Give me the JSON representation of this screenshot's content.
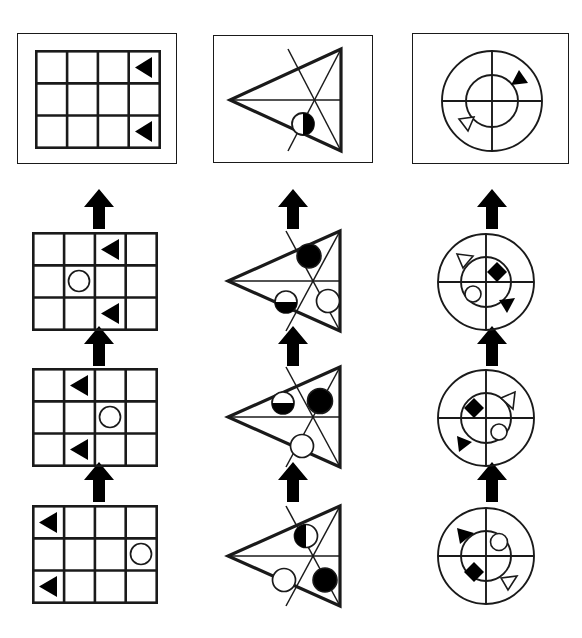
{
  "figure": {
    "type": "visual-reasoning-matrix",
    "columns": [
      {
        "id": "column-grid",
        "shape_kind": "grid",
        "grid_cols": 4,
        "grid_rows": 3,
        "panel": {
          "label": "grid-panel-top",
          "framed": true,
          "items": [
            {
              "glyph": "left-triangle-filled",
              "row": 1,
              "col": 4
            },
            {
              "glyph": "left-triangle-filled",
              "row": 3,
              "col": 4
            }
          ]
        },
        "steps": [
          {
            "label": "grid-step-3",
            "items": [
              {
                "glyph": "left-triangle-filled",
                "row": 1,
                "col": 3
              },
              {
                "glyph": "circle-open",
                "row": 2,
                "col": 2
              },
              {
                "glyph": "left-triangle-filled",
                "row": 3,
                "col": 3
              }
            ]
          },
          {
            "label": "grid-step-2",
            "items": [
              {
                "glyph": "left-triangle-filled",
                "row": 1,
                "col": 2
              },
              {
                "glyph": "circle-open",
                "row": 2,
                "col": 3
              },
              {
                "glyph": "left-triangle-filled",
                "row": 3,
                "col": 2
              }
            ]
          },
          {
            "label": "grid-step-1",
            "items": [
              {
                "glyph": "left-triangle-filled",
                "row": 1,
                "col": 1
              },
              {
                "glyph": "circle-open",
                "row": 2,
                "col": 4
              },
              {
                "glyph": "left-triangle-filled",
                "row": 3,
                "col": 1
              }
            ]
          }
        ]
      },
      {
        "id": "column-triangle",
        "shape_kind": "triangle",
        "panel": {
          "label": "triangle-panel-top",
          "framed": true,
          "items": [
            {
              "glyph": "circle-half-right",
              "region": "lower-middle"
            }
          ]
        },
        "steps": [
          {
            "label": "triangle-step-3",
            "items": [
              {
                "glyph": "circle-filled",
                "region": "upper"
              },
              {
                "glyph": "circle-half-bottom",
                "region": "lower-left"
              },
              {
                "glyph": "circle-open",
                "region": "right"
              }
            ]
          },
          {
            "label": "triangle-step-2",
            "items": [
              {
                "glyph": "circle-half-bottom",
                "region": "upper-left"
              },
              {
                "glyph": "circle-filled",
                "region": "upper-right"
              },
              {
                "glyph": "circle-open",
                "region": "lower"
              }
            ]
          },
          {
            "label": "triangle-step-1",
            "items": [
              {
                "glyph": "circle-half-left",
                "region": "upper"
              },
              {
                "glyph": "circle-open",
                "region": "lower-left"
              },
              {
                "glyph": "circle-filled",
                "region": "lower-right"
              }
            ]
          }
        ]
      },
      {
        "id": "column-circle",
        "shape_kind": "concentric-circles",
        "panel": {
          "label": "circle-panel-top",
          "framed": true,
          "items": [
            {
              "glyph": "triangle-filled",
              "region": "outer-upper-right"
            },
            {
              "glyph": "triangle-open",
              "region": "outer-lower-left"
            }
          ]
        },
        "steps": [
          {
            "label": "circle-step-3",
            "items": [
              {
                "glyph": "triangle-open",
                "region": "outer-upper-left"
              },
              {
                "glyph": "diamond-filled",
                "region": "inner-upper-right"
              },
              {
                "glyph": "circle-open-small",
                "region": "inner-lower-left"
              },
              {
                "glyph": "triangle-filled",
                "region": "outer-lower-right"
              }
            ]
          },
          {
            "label": "circle-step-2",
            "items": [
              {
                "glyph": "triangle-open",
                "region": "outer-upper-right"
              },
              {
                "glyph": "diamond-filled",
                "region": "inner-upper-left"
              },
              {
                "glyph": "circle-open-small",
                "region": "inner-lower-right"
              },
              {
                "glyph": "triangle-filled",
                "region": "outer-lower-left"
              }
            ]
          },
          {
            "label": "circle-step-1",
            "items": [
              {
                "glyph": "triangle-filled",
                "region": "outer-upper-left"
              },
              {
                "glyph": "circle-open-small",
                "region": "inner-upper-right"
              },
              {
                "glyph": "diamond-filled",
                "region": "inner-lower-left"
              },
              {
                "glyph": "triangle-open",
                "region": "outer-lower-right"
              }
            ]
          }
        ]
      }
    ],
    "arrows": {
      "glyph": "arrow-up",
      "count_per_column": 3,
      "direction": "up"
    },
    "colors": {
      "stroke": "#1a1a1a",
      "fill": "#000000",
      "background": "#ffffff"
    }
  }
}
